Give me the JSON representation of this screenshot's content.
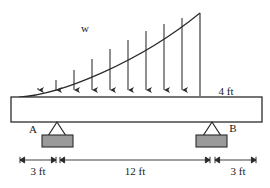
{
  "figure": {
    "type": "beam-loading-diagram",
    "colors": {
      "line": "#2b2b2b",
      "beam_fill": "#ffffff",
      "support_block_fill": "#9a9a9a",
      "support_block_stroke": "#2b2b2b",
      "background": "#ffffff",
      "text": "#1a1a1a"
    },
    "load": {
      "label": "w",
      "distribution": "triangular-curved",
      "arrow_count": 9,
      "arrow_direction": "down",
      "peak_side": "right"
    },
    "supports": [
      {
        "id": "A",
        "label": "A",
        "type": "pin-triangle-on-block"
      },
      {
        "id": "B",
        "label": "B",
        "type": "pin-triangle-on-block"
      }
    ],
    "beam": {
      "depth_label": "4 ft"
    },
    "dimensions": [
      {
        "label": "3 ft",
        "segment": "left-overhang"
      },
      {
        "label": "12 ft",
        "segment": "span-A-to-B"
      },
      {
        "label": "3 ft",
        "segment": "right-overhang"
      }
    ]
  },
  "labels": {
    "load_w": "w",
    "support_a": "A",
    "support_b": "B",
    "beam_depth": "4 ft",
    "dim_left": "3 ft",
    "dim_mid": "12 ft",
    "dim_right": "3 ft"
  }
}
